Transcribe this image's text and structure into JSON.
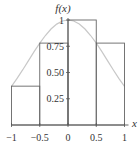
{
  "chart_data": {
    "type": "bar",
    "title": "",
    "xlabel": "x",
    "ylabel": "f(x)",
    "xlim": [
      -1,
      1
    ],
    "ylim": [
      0,
      1
    ],
    "x_ticks": [
      -1,
      -0.5,
      0,
      0.5,
      1
    ],
    "x_tick_labels": [
      "−1",
      "−0.5",
      "0",
      "0.5",
      "1"
    ],
    "y_ticks": [
      0.25,
      0.5,
      0.75,
      1
    ],
    "y_tick_labels": [
      "0.25",
      "0.50",
      "0.75",
      "1"
    ],
    "grid": false,
    "legend": null,
    "rectangles": [
      {
        "x0": -1,
        "x1": -0.5,
        "height": 0.37
      },
      {
        "x0": -0.5,
        "x1": 0,
        "height": 0.78
      },
      {
        "x0": 0,
        "x1": 0.5,
        "height": 1.0
      },
      {
        "x0": 0.5,
        "x1": 1,
        "height": 0.78
      }
    ],
    "curve": {
      "x": [
        -1,
        -0.9,
        -0.8,
        -0.7,
        -0.6,
        -0.5,
        -0.4,
        -0.3,
        -0.2,
        -0.1,
        0,
        0.1,
        0.2,
        0.3,
        0.4,
        0.5,
        0.6,
        0.7,
        0.8,
        0.9,
        1
      ],
      "y": [
        0.368,
        0.445,
        0.527,
        0.613,
        0.698,
        0.779,
        0.852,
        0.914,
        0.961,
        0.99,
        1.0,
        0.99,
        0.961,
        0.914,
        0.852,
        0.779,
        0.698,
        0.613,
        0.527,
        0.445,
        0.368
      ]
    },
    "colors": {
      "rect_stroke": "#666666",
      "curve": "#c8c8c8",
      "axis": "#555555",
      "text": "#333333"
    }
  }
}
